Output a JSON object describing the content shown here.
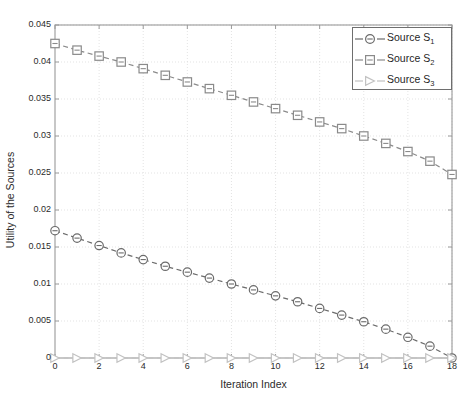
{
  "figure": {
    "background_color": "#ffffff",
    "axes_color": "#9a9a9a",
    "grid_color": "#dcdcdc",
    "text_color": "#2b2b2b"
  },
  "chart_data": {
    "type": "line",
    "title": "",
    "xlabel": "Iteration Index",
    "ylabel": "Utility of the Sources",
    "xlim": [
      0,
      18
    ],
    "ylim": [
      0,
      0.045
    ],
    "grid": true,
    "legend_position": "upper right",
    "xticks": [
      0,
      2,
      4,
      6,
      8,
      10,
      12,
      14,
      16,
      18
    ],
    "xtick_labels": [
      "0",
      "2",
      "4",
      "6",
      "8",
      "10",
      "12",
      "14",
      "16",
      "18"
    ],
    "yticks": [
      0,
      0.005,
      0.01,
      0.015,
      0.02,
      0.025,
      0.03,
      0.035,
      0.04,
      0.045
    ],
    "ytick_labels": [
      "0",
      "0.005",
      "0.01",
      "0.015",
      "0.02",
      "0.025",
      "0.03",
      "0.035",
      "0.04",
      "0.045"
    ],
    "x": [
      0,
      1,
      2,
      3,
      4,
      5,
      6,
      7,
      8,
      9,
      10,
      11,
      12,
      13,
      14,
      15,
      16,
      17,
      18
    ],
    "series": [
      {
        "name": "Source S1",
        "legend_label": "Source S",
        "legend_subscript": "1",
        "marker": "circle",
        "linestyle": "dashed",
        "color": "#6b6b6b",
        "values": [
          0.0172,
          0.0162,
          0.0152,
          0.0142,
          0.0133,
          0.0124,
          0.0116,
          0.0108,
          0.01,
          0.0092,
          0.0084,
          0.0076,
          0.0067,
          0.0058,
          0.0049,
          0.0039,
          0.0028,
          0.0016,
          0.0
        ]
      },
      {
        "name": "Source S2",
        "legend_label": "Source S",
        "legend_subscript": "2",
        "marker": "square",
        "linestyle": "dashed",
        "color": "#8a8a8a",
        "values": [
          0.0425,
          0.0416,
          0.0408,
          0.04,
          0.0391,
          0.0382,
          0.0373,
          0.0364,
          0.0355,
          0.0346,
          0.0337,
          0.0328,
          0.0319,
          0.031,
          0.03,
          0.029,
          0.0279,
          0.0266,
          0.0248
        ]
      },
      {
        "name": "Source S3",
        "legend_label": "Source S",
        "legend_subscript": "3",
        "marker": "triangle-right",
        "linestyle": "dashed",
        "color": "#c2c2c2",
        "values": [
          0,
          0,
          0,
          0,
          0,
          0,
          0,
          0,
          0,
          0,
          0,
          0,
          0,
          0,
          0,
          0,
          0,
          0,
          0
        ]
      }
    ]
  },
  "legend": {
    "entries": [
      {
        "label": "Source S",
        "subscript": "1",
        "marker": "circle"
      },
      {
        "label": "Source S",
        "subscript": "2",
        "marker": "square"
      },
      {
        "label": "Source S",
        "subscript": "3",
        "marker": "triangle-right"
      }
    ]
  },
  "top_caption": ""
}
